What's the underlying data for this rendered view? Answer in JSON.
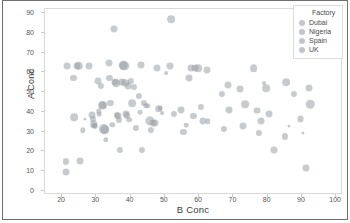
{
  "chart_data": {
    "type": "scatter",
    "title": "",
    "xlabel": "B Conc",
    "ylabel": "A Conc",
    "xlim": [
      15,
      102
    ],
    "ylim": [
      -2,
      92
    ],
    "xticks": [
      20,
      30,
      40,
      50,
      60,
      70,
      80,
      90,
      100
    ],
    "yticks": [
      0,
      10,
      20,
      30,
      40,
      50,
      60,
      70,
      80,
      90
    ],
    "grid": false,
    "legend": {
      "position": "top-right",
      "title": "Factory",
      "entries": [
        "Dubai",
        "Nigeria",
        "Spain",
        "UK"
      ]
    },
    "marker_color": "#9aa0a6",
    "marker_opacity": 0.55,
    "series": [
      {
        "name": "All factories",
        "points": [
          {
            "x": 21.0,
            "y": 9.8,
            "s": 4.5
          },
          {
            "x": 21.2,
            "y": 15.0,
            "s": 4.0
          },
          {
            "x": 21.4,
            "y": 63.4,
            "s": 4.5
          },
          {
            "x": 23.3,
            "y": 57.2,
            "s": 4.0
          },
          {
            "x": 23.5,
            "y": 37.2,
            "s": 5.0
          },
          {
            "x": 24.3,
            "y": 63.4,
            "s": 4.5
          },
          {
            "x": 24.9,
            "y": 63.4,
            "s": 5.5
          },
          {
            "x": 25.3,
            "y": 15.0,
            "s": 4.5
          },
          {
            "x": 26.0,
            "y": 30.7,
            "s": 3.5
          },
          {
            "x": 26.6,
            "y": 36.6,
            "s": 2.0
          },
          {
            "x": 27.8,
            "y": 63.3,
            "s": 4.5
          },
          {
            "x": 28.6,
            "y": 38.6,
            "s": 4.5
          },
          {
            "x": 29.0,
            "y": 36.6,
            "s": 4.0
          },
          {
            "x": 29.2,
            "y": 34.0,
            "s": 5.0
          },
          {
            "x": 29.4,
            "y": 33.2,
            "s": 3.0
          },
          {
            "x": 29.6,
            "y": 33.0,
            "s": 4.0
          },
          {
            "x": 30.4,
            "y": 55.6,
            "s": 4.5
          },
          {
            "x": 30.7,
            "y": 40.2,
            "s": 3.5
          },
          {
            "x": 30.9,
            "y": 38.8,
            "s": 3.0
          },
          {
            "x": 31.3,
            "y": 53.0,
            "s": 4.0
          },
          {
            "x": 31.6,
            "y": 43.4,
            "s": 5.0
          },
          {
            "x": 31.9,
            "y": 43.3,
            "s": 5.0
          },
          {
            "x": 32.2,
            "y": 31.4,
            "s": 6.5
          },
          {
            "x": 32.4,
            "y": 31.0,
            "s": 6.0
          },
          {
            "x": 32.8,
            "y": 26.0,
            "s": 3.5
          },
          {
            "x": 33.6,
            "y": 64.5,
            "s": 4.5
          },
          {
            "x": 33.8,
            "y": 57.0,
            "s": 4.0
          },
          {
            "x": 34.1,
            "y": 44.6,
            "s": 4.0
          },
          {
            "x": 34.6,
            "y": 33.4,
            "s": 3.5
          },
          {
            "x": 35.2,
            "y": 82.0,
            "s": 4.5
          },
          {
            "x": 35.4,
            "y": 55.0,
            "s": 4.5
          },
          {
            "x": 35.8,
            "y": 54.6,
            "s": 5.0
          },
          {
            "x": 36.0,
            "y": 38.3,
            "s": 4.0
          },
          {
            "x": 36.3,
            "y": 37.8,
            "s": 4.5
          },
          {
            "x": 36.6,
            "y": 36.0,
            "s": 4.0
          },
          {
            "x": 36.8,
            "y": 20.9,
            "s": 4.0
          },
          {
            "x": 37.4,
            "y": 55.2,
            "s": 4.5
          },
          {
            "x": 37.8,
            "y": 63.5,
            "s": 5.5
          },
          {
            "x": 38.2,
            "y": 63.4,
            "s": 6.0
          },
          {
            "x": 38.4,
            "y": 54.8,
            "s": 5.0
          },
          {
            "x": 38.6,
            "y": 38.7,
            "s": 4.5
          },
          {
            "x": 38.9,
            "y": 38.2,
            "s": 4.0
          },
          {
            "x": 39.2,
            "y": 53.2,
            "s": 4.5
          },
          {
            "x": 39.6,
            "y": 36.0,
            "s": 3.5
          },
          {
            "x": 40.0,
            "y": 55.6,
            "s": 4.0
          },
          {
            "x": 40.4,
            "y": 44.3,
            "s": 5.0
          },
          {
            "x": 40.9,
            "y": 52.7,
            "s": 4.0
          },
          {
            "x": 41.5,
            "y": 31.9,
            "s": 4.0
          },
          {
            "x": 42.3,
            "y": 48.0,
            "s": 4.0
          },
          {
            "x": 42.7,
            "y": 39.8,
            "s": 3.0
          },
          {
            "x": 43.1,
            "y": 63.9,
            "s": 4.5
          },
          {
            "x": 43.4,
            "y": 20.9,
            "s": 4.0
          },
          {
            "x": 43.9,
            "y": 44.6,
            "s": 4.0
          },
          {
            "x": 44.4,
            "y": 43.2,
            "s": 3.5
          },
          {
            "x": 45.0,
            "y": 43.0,
            "s": 3.5
          },
          {
            "x": 45.6,
            "y": 35.6,
            "s": 6.0
          },
          {
            "x": 46.0,
            "y": 30.8,
            "s": 4.0
          },
          {
            "x": 46.6,
            "y": 34.3,
            "s": 4.5
          },
          {
            "x": 47.2,
            "y": 34.2,
            "s": 4.5
          },
          {
            "x": 47.8,
            "y": 62.4,
            "s": 4.5
          },
          {
            "x": 48.2,
            "y": 41.6,
            "s": 5.0
          },
          {
            "x": 48.6,
            "y": 42.0,
            "s": 3.0
          },
          {
            "x": 49.2,
            "y": 39.2,
            "s": 2.5
          },
          {
            "x": 50.3,
            "y": 59.5,
            "s": 2.5
          },
          {
            "x": 51.6,
            "y": 63.0,
            "s": 4.5
          },
          {
            "x": 51.8,
            "y": 86.8,
            "s": 5.0
          },
          {
            "x": 52.6,
            "y": 38.9,
            "s": 4.0
          },
          {
            "x": 54.8,
            "y": 40.9,
            "s": 4.5
          },
          {
            "x": 55.4,
            "y": 29.7,
            "s": 4.0
          },
          {
            "x": 56.3,
            "y": 33.3,
            "s": 3.0
          },
          {
            "x": 57.0,
            "y": 56.9,
            "s": 4.5
          },
          {
            "x": 57.6,
            "y": 62.3,
            "s": 4.5
          },
          {
            "x": 58.3,
            "y": 37.8,
            "s": 4.0
          },
          {
            "x": 58.9,
            "y": 62.3,
            "s": 4.5
          },
          {
            "x": 59.6,
            "y": 62.2,
            "s": 5.0
          },
          {
            "x": 60.4,
            "y": 42.4,
            "s": 4.0
          },
          {
            "x": 61.0,
            "y": 35.6,
            "s": 4.5
          },
          {
            "x": 62.2,
            "y": 61.1,
            "s": 4.5
          },
          {
            "x": 62.6,
            "y": 35.3,
            "s": 3.5
          },
          {
            "x": 66.6,
            "y": 49.2,
            "s": 4.0
          },
          {
            "x": 67.3,
            "y": 31.3,
            "s": 4.0
          },
          {
            "x": 68.4,
            "y": 53.6,
            "s": 4.5
          },
          {
            "x": 68.8,
            "y": 40.9,
            "s": 4.5
          },
          {
            "x": 71.8,
            "y": 51.6,
            "s": 4.5
          },
          {
            "x": 72.7,
            "y": 33.0,
            "s": 4.5
          },
          {
            "x": 73.4,
            "y": 43.9,
            "s": 5.0
          },
          {
            "x": 75.9,
            "y": 62.0,
            "s": 5.0
          },
          {
            "x": 77.0,
            "y": 40.7,
            "s": 4.5
          },
          {
            "x": 77.4,
            "y": 29.5,
            "s": 4.0
          },
          {
            "x": 78.2,
            "y": 35.3,
            "s": 4.5
          },
          {
            "x": 78.9,
            "y": 54.7,
            "s": 2.5
          },
          {
            "x": 79.6,
            "y": 52.2,
            "s": 5.0
          },
          {
            "x": 80.3,
            "y": 38.7,
            "s": 4.5
          },
          {
            "x": 81.8,
            "y": 20.5,
            "s": 4.5
          },
          {
            "x": 85.0,
            "y": 27.6,
            "s": 4.0
          },
          {
            "x": 85.4,
            "y": 54.9,
            "s": 5.0
          },
          {
            "x": 86.2,
            "y": 33.0,
            "s": 2.0
          },
          {
            "x": 87.6,
            "y": 49.2,
            "s": 4.0
          },
          {
            "x": 89.6,
            "y": 36.4,
            "s": 4.5
          },
          {
            "x": 90.2,
            "y": 29.4,
            "s": 2.0
          },
          {
            "x": 91.3,
            "y": 11.4,
            "s": 4.5
          },
          {
            "x": 92.2,
            "y": 52.1,
            "s": 4.5
          },
          {
            "x": 92.4,
            "y": 43.9,
            "s": 5.5
          }
        ]
      }
    ]
  }
}
